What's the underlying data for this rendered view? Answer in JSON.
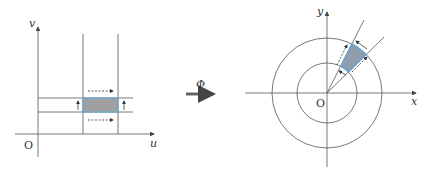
{
  "left_diagram": {
    "axis_x_label": "u",
    "axis_y_label": "v",
    "origin_label": "O",
    "region_fill": "#999999",
    "region_border": "#5fa8d8"
  },
  "map_arrow": {
    "label": "Φ"
  },
  "right_diagram": {
    "axis_x_label": "x",
    "axis_y_label": "y",
    "origin_label": "O",
    "region_fill": "#8a9ab0",
    "region_border": "#5fa8d8"
  },
  "colors": {
    "line": "#555555",
    "highlight": "#5fa8d8"
  }
}
